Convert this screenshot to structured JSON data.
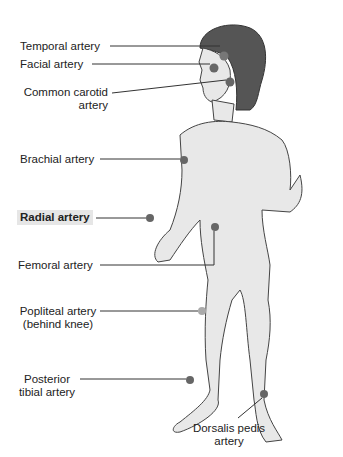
{
  "diagram": {
    "type": "anatomical-pulse-points",
    "colors": {
      "skin": "#e8e8e8",
      "outline": "#444444",
      "hair": "#555555",
      "pulse_dot": "#666666",
      "pulse_dot_light": "#aaaaaa",
      "highlight_bg": "#e6e6e6"
    },
    "labels": {
      "temporal": "Temporal artery",
      "facial": "Facial artery",
      "carotid_1": "Common carotid",
      "carotid_2": "artery",
      "brachial": "Brachial artery",
      "radial": "Radial artery",
      "femoral": "Femoral artery",
      "popliteal_1": "Popliteal artery",
      "popliteal_2": "(behind knee)",
      "posterior_tibial_1": "Posterior",
      "posterior_tibial_2": "tibial artery",
      "dorsalis_1": "Dorsalis pedis",
      "dorsalis_2": "artery"
    },
    "highlighted": "Radial artery"
  }
}
